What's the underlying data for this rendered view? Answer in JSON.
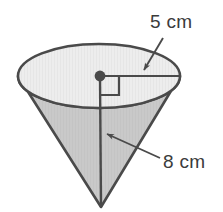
{
  "figure": {
    "name": "cone-with-dimensions",
    "type": "geometry-diagram",
    "shape": "cone",
    "orientation": "apex-down",
    "background_color": "#ffffff"
  },
  "labels": {
    "radius": {
      "text": "5 cm",
      "value": 5,
      "unit": "cm",
      "measures": "radius",
      "x": 150,
      "y": 28
    },
    "height": {
      "text": "8 cm",
      "value": 8,
      "unit": "cm",
      "measures": "height",
      "x": 163,
      "y": 168
    }
  },
  "colors": {
    "outline": "#4a4a4a",
    "top_face_fill": "#ededed",
    "body_fill": "#c9c9c9",
    "label_text": "#3b3b3b",
    "leader_line": "#4a4a4a",
    "center_dot": "#4a4a4a"
  },
  "geometry": {
    "ellipse_center_x": 99,
    "ellipse_center_y": 76,
    "ellipse_rx": 81,
    "ellipse_ry": 32,
    "apex_x": 101,
    "apex_y": 207,
    "radius_line_end_x": 180,
    "right_angle_marker_size": 19
  },
  "annotations": {
    "center_dot_name": "cone-center-point",
    "radius_line_name": "radius-segment",
    "height_line_name": "height-axis-segment",
    "right_angle_name": "right-angle-marker",
    "radius_arrow_name": "radius-leader-arrow",
    "height_arrow_name": "height-leader-arrow"
  }
}
